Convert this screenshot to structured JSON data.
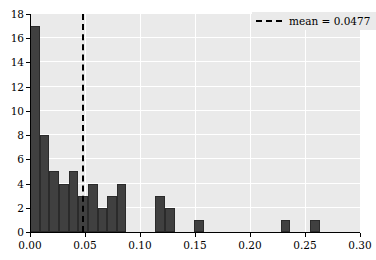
{
  "chart_data": {
    "type": "bar",
    "subtype": "histogram",
    "title": "",
    "xlabel": "",
    "ylabel": "",
    "xlim": [
      0.0,
      0.3
    ],
    "ylim": [
      0,
      18
    ],
    "grid": true,
    "xticks": [
      0.0,
      0.05,
      0.1,
      0.15,
      0.2,
      0.25,
      0.3
    ],
    "xtick_labels": [
      "0.00",
      "0.05",
      "0.10",
      "0.15",
      "0.20",
      "0.25",
      "0.30"
    ],
    "yticks": [
      0,
      2,
      4,
      6,
      8,
      10,
      12,
      14,
      16,
      18
    ],
    "ytick_labels": [
      "0",
      "2",
      "4",
      "6",
      "8",
      "10",
      "12",
      "14",
      "16",
      "18"
    ],
    "bin_width": 0.00877,
    "bar_color": "#404040",
    "background_color": "#eaeaea",
    "bins": [
      {
        "left": 0.0,
        "right": 0.0088,
        "count": 17
      },
      {
        "left": 0.0088,
        "right": 0.0175,
        "count": 8
      },
      {
        "left": 0.0175,
        "right": 0.0263,
        "count": 5
      },
      {
        "left": 0.0263,
        "right": 0.0351,
        "count": 4
      },
      {
        "left": 0.0351,
        "right": 0.0438,
        "count": 5
      },
      {
        "left": 0.0438,
        "right": 0.0526,
        "count": 3
      },
      {
        "left": 0.0526,
        "right": 0.0614,
        "count": 4
      },
      {
        "left": 0.0614,
        "right": 0.0701,
        "count": 2
      },
      {
        "left": 0.0701,
        "right": 0.0789,
        "count": 3
      },
      {
        "left": 0.0789,
        "right": 0.0877,
        "count": 4
      },
      {
        "left": 0.0877,
        "right": 0.0965,
        "count": 0
      },
      {
        "left": 0.0965,
        "right": 0.1053,
        "count": 0
      },
      {
        "left": 0.1053,
        "right": 0.114,
        "count": 0
      },
      {
        "left": 0.114,
        "right": 0.1228,
        "count": 3
      },
      {
        "left": 0.1228,
        "right": 0.1316,
        "count": 2
      },
      {
        "left": 0.1316,
        "right": 0.1404,
        "count": 0
      },
      {
        "left": 0.1404,
        "right": 0.1491,
        "count": 0
      },
      {
        "left": 0.1491,
        "right": 0.1579,
        "count": 1
      },
      {
        "left": 0.1579,
        "right": 0.1667,
        "count": 0
      },
      {
        "left": 0.1667,
        "right": 0.1754,
        "count": 0
      },
      {
        "left": 0.1754,
        "right": 0.1842,
        "count": 0
      },
      {
        "left": 0.1842,
        "right": 0.193,
        "count": 0
      },
      {
        "left": 0.193,
        "right": 0.2018,
        "count": 0
      },
      {
        "left": 0.2018,
        "right": 0.2105,
        "count": 0
      },
      {
        "left": 0.2105,
        "right": 0.2193,
        "count": 0
      },
      {
        "left": 0.2193,
        "right": 0.2281,
        "count": 0
      },
      {
        "left": 0.2281,
        "right": 0.2368,
        "count": 1
      },
      {
        "left": 0.2368,
        "right": 0.2456,
        "count": 0
      },
      {
        "left": 0.2456,
        "right": 0.2544,
        "count": 0
      },
      {
        "left": 0.2544,
        "right": 0.2632,
        "count": 1
      },
      {
        "left": 0.2632,
        "right": 0.2719,
        "count": 0
      },
      {
        "left": 0.2719,
        "right": 0.2807,
        "count": 0
      },
      {
        "left": 0.2807,
        "right": 0.2895,
        "count": 0
      },
      {
        "left": 0.2895,
        "right": 0.3,
        "count": 0
      }
    ],
    "mean_line": {
      "value": 0.0477,
      "label": "mean = 0.0477",
      "style": "dashed",
      "color": "#000000"
    },
    "legend": {
      "position": "upper right",
      "entries": [
        {
          "label": "mean = 0.0477",
          "style": "dashed",
          "color": "#000000"
        }
      ]
    }
  }
}
